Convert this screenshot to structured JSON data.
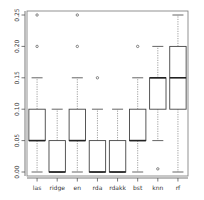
{
  "chart_data": {
    "type": "box",
    "title": "",
    "xlabel": "",
    "ylabel": "",
    "ylim": [
      0.0,
      0.26
    ],
    "grid": false,
    "legend": "none",
    "y_ticks": [
      {
        "value": 0.25,
        "label": "0.25"
      },
      {
        "value": 0.2,
        "label": "0.20"
      },
      {
        "value": 0.15,
        "label": "0.15"
      },
      {
        "value": 0.1,
        "label": "0.10"
      },
      {
        "value": 0.05,
        "label": "0.05"
      },
      {
        "value": 0.0,
        "label": "0.00"
      }
    ],
    "categories": [
      "las",
      "ridge",
      "en",
      "rda",
      "rdakk",
      "bst",
      "knn",
      "rf"
    ],
    "boxes": [
      {
        "label": "las",
        "whisker_low": 0.0,
        "q1": 0.05,
        "median": 0.05,
        "q3": 0.1,
        "whisker_high": 0.15,
        "outliers": [
          0.2,
          0.25
        ]
      },
      {
        "label": "ridge",
        "whisker_low": 0.0,
        "q1": 0.0,
        "median": 0.0,
        "q3": 0.05,
        "whisker_high": 0.1,
        "outliers": []
      },
      {
        "label": "en",
        "whisker_low": 0.0,
        "q1": 0.05,
        "median": 0.05,
        "q3": 0.1,
        "whisker_high": 0.15,
        "outliers": [
          0.2,
          0.25
        ]
      },
      {
        "label": "rda",
        "whisker_low": 0.0,
        "q1": 0.0,
        "median": 0.0,
        "q3": 0.05,
        "whisker_high": 0.1,
        "outliers": [
          0.15
        ]
      },
      {
        "label": "rdakk",
        "whisker_low": 0.0,
        "q1": 0.0,
        "median": 0.0,
        "q3": 0.05,
        "whisker_high": 0.1,
        "outliers": []
      },
      {
        "label": "bst",
        "whisker_low": 0.0,
        "q1": 0.05,
        "median": 0.05,
        "q3": 0.1,
        "whisker_high": 0.15,
        "outliers": [
          0.2
        ]
      },
      {
        "label": "knn",
        "whisker_low": 0.05,
        "q1": 0.1,
        "median": 0.15,
        "q3": 0.15,
        "whisker_high": 0.2,
        "outliers": [
          0.005
        ]
      },
      {
        "label": "rf",
        "whisker_low": 0.0,
        "q1": 0.1,
        "median": 0.15,
        "q3": 0.2,
        "whisker_high": 0.25,
        "outliers": []
      }
    ]
  },
  "colors": {
    "background": "#ffffff",
    "frame": "#777777",
    "box_stroke": "#444444",
    "median": "#222222",
    "whisker": "#777777",
    "text": "#333333"
  }
}
